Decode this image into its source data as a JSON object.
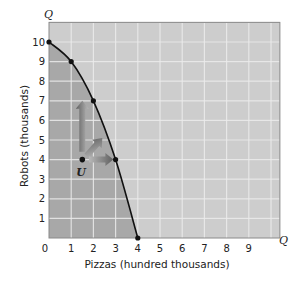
{
  "chart_data": {
    "type": "line",
    "title": "",
    "xlabel": "Pizzas (hundred thousands)",
    "ylabel": "Robots (thousands)",
    "x_axis_end_label": "Q",
    "y_axis_end_label": "Q",
    "xlim": [
      0,
      10.4
    ],
    "ylim": [
      0,
      11
    ],
    "grid": true,
    "x_ticks": [
      "0",
      "1",
      "2",
      "3",
      "4",
      "5",
      "6",
      "7",
      "8",
      "9"
    ],
    "y_ticks": [
      "1",
      "2",
      "3",
      "4",
      "5",
      "6",
      "7",
      "8",
      "9",
      "10"
    ],
    "series": [
      {
        "name": "Production possibilities frontier",
        "x": [
          0,
          1,
          2,
          3,
          4
        ],
        "y": [
          10,
          9,
          7,
          4,
          0
        ]
      }
    ],
    "points": [
      {
        "label": "U",
        "x": 1.5,
        "y": 4
      }
    ],
    "annotations": [
      {
        "type": "arrow",
        "from": [
          1.5,
          4.4
        ],
        "to": [
          1.5,
          7
        ],
        "direction": "up"
      },
      {
        "type": "arrow",
        "from": [
          1.7,
          4.2
        ],
        "to": [
          2.4,
          5.1
        ],
        "direction": "up-right"
      },
      {
        "type": "arrow",
        "from": [
          1.8,
          4
        ],
        "to": [
          2.9,
          4
        ],
        "direction": "right"
      }
    ],
    "colors": {
      "attainable_region": "#a8a8a8",
      "unattainable_region": "#cdcdcd",
      "gridline": "#ececec",
      "curve": "#111111",
      "arrow": "#7a7a7a"
    }
  }
}
